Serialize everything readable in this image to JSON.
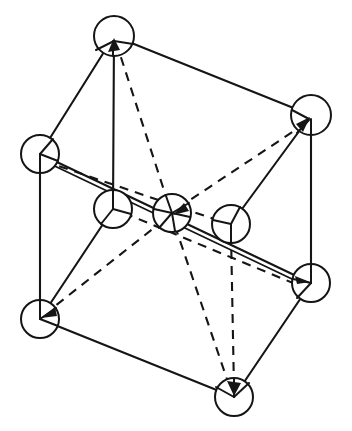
{
  "figure": {
    "type": "crystal-lattice-diagram",
    "background_color": "#ffffff",
    "line_color": "#151515",
    "atom_fill_color": "#ffffff",
    "width": 352,
    "height": 431,
    "atom_radius": 19,
    "atoms": [
      {
        "id": "top",
        "label": "top corner atom",
        "cx": 114,
        "cy": 36,
        "r": 20
      },
      {
        "id": "top-right",
        "label": "upper right corner atom",
        "cx": 311,
        "cy": 115,
        "r": 20
      },
      {
        "id": "top-left",
        "label": "upper left corner atom",
        "cx": 40,
        "cy": 154,
        "r": 19
      },
      {
        "id": "mid-left",
        "label": "middle left atom",
        "cx": 113,
        "cy": 209,
        "r": 19
      },
      {
        "id": "center",
        "label": "body centre atom",
        "cx": 172,
        "cy": 213,
        "r": 19
      },
      {
        "id": "mid-right",
        "label": "middle right atom",
        "cx": 231,
        "cy": 224,
        "r": 19
      },
      {
        "id": "bottom-right",
        "label": "lower right corner atom",
        "cx": 311,
        "cy": 283,
        "r": 19
      },
      {
        "id": "bottom-left",
        "label": "lower left corner atom",
        "cx": 40,
        "cy": 319,
        "r": 19
      },
      {
        "id": "bottom",
        "label": "bottom corner atom",
        "cx": 234,
        "cy": 397,
        "r": 19
      }
    ],
    "solid_edges": [
      {
        "id": "top--top-right",
        "x1": 114,
        "y1": 36,
        "x2": 311,
        "y2": 115
      },
      {
        "id": "top--top-left",
        "x1": 114,
        "y1": 36,
        "x2": 40,
        "y2": 154
      },
      {
        "id": "top--mid-left",
        "x1": 114,
        "y1": 36,
        "x2": 113,
        "y2": 209
      },
      {
        "id": "top-left--bottom-right",
        "x1": 40,
        "y1": 154,
        "x2": 311,
        "y2": 283
      },
      {
        "id": "top-left--bottom-left",
        "x1": 40,
        "y1": 154,
        "x2": 40,
        "y2": 319
      },
      {
        "id": "top-right--bottom-right",
        "x1": 311,
        "y1": 115,
        "x2": 311,
        "y2": 283
      },
      {
        "id": "top-right--mid-right",
        "x1": 311,
        "y1": 115,
        "x2": 231,
        "y2": 224
      },
      {
        "id": "mid-left--bottom-left",
        "x1": 113,
        "y1": 209,
        "x2": 40,
        "y2": 319
      },
      {
        "id": "bottom-left--bottom",
        "x1": 40,
        "y1": 319,
        "x2": 234,
        "y2": 397
      },
      {
        "id": "bottom--bottom-right",
        "x1": 234,
        "y1": 397,
        "x2": 311,
        "y2": 283
      }
    ],
    "dashed_edges": [
      {
        "id": "top--center",
        "x1": 114,
        "y1": 40,
        "x2": 172,
        "y2": 213
      },
      {
        "id": "top-left--mid-right",
        "x1": 44,
        "y1": 160,
        "x2": 248,
        "y2": 230
      },
      {
        "id": "center--top-right",
        "x1": 176,
        "y1": 209,
        "x2": 311,
        "y2": 119
      },
      {
        "id": "center--bottom-left",
        "x1": 166,
        "y1": 219,
        "x2": 44,
        "y2": 315
      },
      {
        "id": "center--bottom",
        "x1": 174,
        "y1": 224,
        "x2": 231,
        "y2": 392
      },
      {
        "id": "mid-right--bottom",
        "x1": 231,
        "y1": 233,
        "x2": 234,
        "y2": 388
      },
      {
        "id": "mid-left--bottom-right",
        "x1": 122,
        "y1": 212,
        "x2": 307,
        "y2": 287
      }
    ],
    "arrow_heads": [
      {
        "id": "arrow-top",
        "x": 114,
        "y": 41,
        "angle": 290
      },
      {
        "id": "arrow-top-right",
        "x": 309,
        "y": 120,
        "angle": 305
      },
      {
        "id": "arrow-bottom-left",
        "x": 44,
        "y": 316,
        "angle": 135
      },
      {
        "id": "arrow-bottom",
        "x": 234,
        "y": 392,
        "angle": 80
      },
      {
        "id": "arrow-bottom-right",
        "x": 306,
        "y": 284,
        "angle": 20
      }
    ]
  }
}
